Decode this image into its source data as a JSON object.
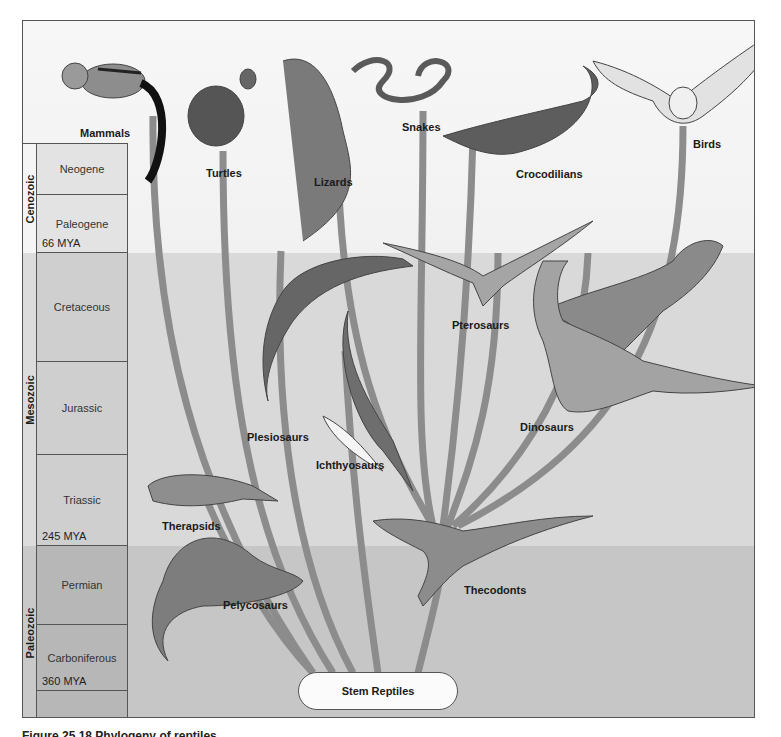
{
  "diagram": {
    "type": "phylogenetic-tree",
    "root": {
      "label": "Stem Reptiles"
    },
    "timescale": {
      "eras": [
        {
          "name": "Cenozoic",
          "periods": [
            "Neogene",
            "Paleogene"
          ],
          "boundary": "66 MYA"
        },
        {
          "name": "Mesozoic",
          "periods": [
            "Cretaceous",
            "Jurassic",
            "Triassic"
          ],
          "boundary": "245 MYA"
        },
        {
          "name": "Paleozoic",
          "periods": [
            "Permian",
            "Carboniferous"
          ],
          "boundary": "360 MYA"
        }
      ]
    },
    "extant_groups": [
      "Mammals",
      "Turtles",
      "Lizards",
      "Snakes",
      "Crocodilians",
      "Birds"
    ],
    "extinct_groups": [
      "Plesiosaurs",
      "Ichthyosaurs",
      "Pterosaurs",
      "Dinosaurs",
      "Therapsids",
      "Pelycosaurs",
      "Thecodonts"
    ]
  },
  "eras": {
    "cenozoic": "Cenozoic",
    "mesozoic": "Mesozoic",
    "paleozoic": "Paleozoic"
  },
  "periods": {
    "neogene": "Neogene",
    "paleogene": "Paleogene",
    "cretaceous": "Cretaceous",
    "jurassic": "Jurassic",
    "triassic": "Triassic",
    "permian": "Permian",
    "carboniferous": "Carboniferous"
  },
  "boundaries": {
    "cenozoic_start": "66 MYA",
    "mesozoic_start": "245 MYA",
    "carboniferous_mark": "360 MYA"
  },
  "labels": {
    "mammals": "Mammals",
    "turtles": "Turtles",
    "lizards": "Lizards",
    "snakes": "Snakes",
    "crocodilians": "Crocodilians",
    "birds": "Birds",
    "plesiosaurs": "Plesiosaurs",
    "ichthyosaurs": "Ichthyosaurs",
    "pterosaurs": "Pterosaurs",
    "dinosaurs": "Dinosaurs",
    "therapsids": "Therapsids",
    "pelycosaurs": "Pelycosaurs",
    "thecodonts": "Thecodonts",
    "stem_reptiles": "Stem Reptiles"
  },
  "caption": "Figure 25.18 Phylogeny of reptiles",
  "colors": {
    "branch": "#8a8a8a",
    "cenozoic_bg": "#f4f4f4",
    "mesozoic_bg": "#d9d9d9",
    "paleozoic_bg": "#c6c6c6"
  }
}
